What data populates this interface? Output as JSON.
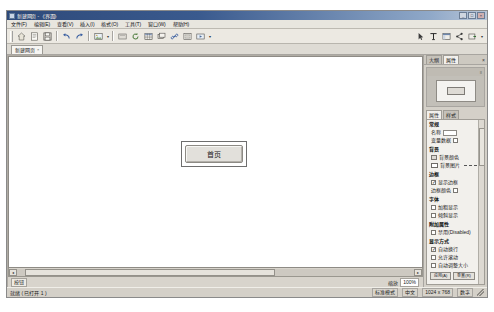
{
  "window": {
    "title": "新建网页 - 《界面》",
    "icon_name": "app-icon",
    "buttons": {
      "minimize": "_",
      "maximize": "□",
      "close": "×"
    }
  },
  "menubar": {
    "items": [
      {
        "label": "文件(F)"
      },
      {
        "label": "编辑(E)"
      },
      {
        "label": "查看(V)"
      },
      {
        "label": "插入(I)"
      },
      {
        "label": "格式(O)"
      },
      {
        "label": "工具(T)"
      },
      {
        "label": "窗口(W)"
      },
      {
        "label": "帮助(H)"
      }
    ]
  },
  "toolbar": {
    "items": [
      {
        "name": "home-icon",
        "label": "主页"
      },
      {
        "name": "new-page-icon",
        "label": "新建"
      },
      {
        "name": "save-icon",
        "label": "保存"
      },
      {
        "name": "undo-icon",
        "label": "撤销"
      },
      {
        "name": "redo-icon",
        "label": "重做"
      },
      {
        "name": "image-icon",
        "label": "图片"
      },
      {
        "name": "preview-icon",
        "label": "预览"
      },
      {
        "name": "refresh-icon",
        "label": "刷新"
      },
      {
        "name": "table-icon",
        "label": "表格"
      },
      {
        "name": "layer-icon",
        "label": "图层"
      },
      {
        "name": "link-icon",
        "label": "超链接"
      },
      {
        "name": "form-icon",
        "label": "表单"
      },
      {
        "name": "media-icon",
        "label": "媒体"
      }
    ],
    "right_items": [
      {
        "name": "pointer-icon",
        "label": "指针"
      },
      {
        "name": "text-tool-icon",
        "label": "文本"
      },
      {
        "name": "layout-icon",
        "label": "布局"
      },
      {
        "name": "share-icon",
        "label": "分享"
      },
      {
        "name": "publish-icon",
        "label": "发布"
      }
    ]
  },
  "doc_tabs": [
    {
      "label": "新建网页",
      "close": "×"
    }
  ],
  "canvas": {
    "widget": {
      "label": "首页",
      "name": "page-button",
      "selected": true
    }
  },
  "canvas_footer": {
    "tag": "按钮",
    "zoom_label": "缩放",
    "zoom_value": "100%"
  },
  "dock": {
    "tabs": [
      {
        "label": "大纲",
        "active": false
      },
      {
        "label": "属性",
        "active": true
      }
    ],
    "close": "×",
    "preview_panel": {
      "header_mark": "≡",
      "page_name": "预览"
    },
    "prop_tabs": [
      {
        "label": "属性",
        "active": true
      },
      {
        "label": "样式",
        "active": false
      },
      {
        "label": "事件",
        "active": false
      }
    ],
    "groups": [
      {
        "title": "常规",
        "rows": [
          {
            "kind": "field",
            "label": "名称",
            "value": ""
          },
          {
            "kind": "checkbox",
            "label": "变量数据",
            "checked": false
          }
        ]
      },
      {
        "title": "背景",
        "rows": [
          {
            "kind": "swatch",
            "label": "背景颜色",
            "color": "#ffffff"
          },
          {
            "kind": "swatch-dash",
            "label": "背景图片",
            "color": "#ffffff"
          }
        ]
      },
      {
        "title": "边框",
        "rows": [
          {
            "kind": "checkbox",
            "label": "显示边框",
            "checked": true
          },
          {
            "kind": "swatch",
            "label": "边框颜色",
            "color": "#ffffff"
          }
        ]
      },
      {
        "title": "字体",
        "rows": [
          {
            "kind": "checkbox",
            "label": "加粗显示",
            "checked": false
          },
          {
            "kind": "checkbox",
            "label": "倾斜显示",
            "checked": false
          }
        ]
      },
      {
        "title": "附加属性",
        "rows": [
          {
            "kind": "checkbox",
            "label": "禁用(Disabled)",
            "checked": false
          }
        ]
      },
      {
        "title": "显示方式",
        "rows": [
          {
            "kind": "checkbox",
            "label": "自动换行",
            "checked": true
          },
          {
            "kind": "checkbox",
            "label": "允许滚动",
            "checked": false
          },
          {
            "kind": "checkbox",
            "label": "自动调整大小",
            "checked": false
          }
        ]
      }
    ],
    "buttons": [
      {
        "label": "应用(A)"
      },
      {
        "label": "重置(R)"
      }
    ]
  },
  "statusbar": {
    "left": "就绪 ( 已打开 1 )",
    "cells": [
      {
        "label": "标准模式"
      },
      {
        "label": "中文"
      },
      {
        "label": "1024 x 768"
      },
      {
        "label": "数字"
      }
    ]
  }
}
